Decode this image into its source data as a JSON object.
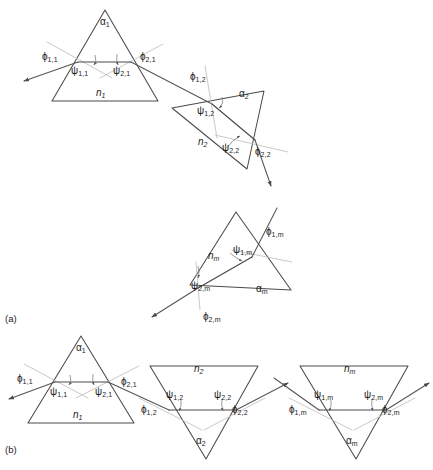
{
  "figure": {
    "background_color": "#ffffff",
    "line_color": "#4a4a4a",
    "normal_color": "#c3c3c3",
    "width": 433,
    "height": 470
  },
  "panels": [
    {
      "id": "a",
      "tag": "(a)",
      "description": "Cascaded prisms with successive rotations"
    },
    {
      "id": "b",
      "tag": "(b)",
      "description": "Alternating upright and inverted prisms in a row"
    }
  ],
  "symbols": {
    "phi": "ϕ",
    "psi": "ψ",
    "alpha": "α",
    "n": "n"
  },
  "labels": {
    "panel_a": {
      "prism1": {
        "apex": {
          "base": "α",
          "sub": "1"
        },
        "index": {
          "base": "n",
          "sub": "1"
        },
        "phi_in": {
          "base": "ϕ",
          "sub": "1,1"
        },
        "phi_out": {
          "base": "ϕ",
          "sub": "2,1"
        },
        "psi_in": {
          "base": "ψ",
          "sub": "1,1"
        },
        "psi_out": {
          "base": "ψ",
          "sub": "2,1"
        }
      },
      "prism2": {
        "apex": {
          "base": "α",
          "sub": "2"
        },
        "index": {
          "base": "n",
          "sub": "2"
        },
        "phi_in": {
          "base": "ϕ",
          "sub": "1,2"
        },
        "phi_out": {
          "base": "ϕ",
          "sub": "2,2"
        },
        "psi_in": {
          "base": "ψ",
          "sub": "1,2"
        },
        "psi_out": {
          "base": "ψ",
          "sub": "2,2"
        }
      },
      "prismM": {
        "apex": {
          "base": "α",
          "sub": "m"
        },
        "index": {
          "base": "n",
          "sub": "m"
        },
        "phi_in": {
          "base": "ϕ",
          "sub": "1,m"
        },
        "phi_out": {
          "base": "ϕ",
          "sub": "2,m"
        },
        "psi_in": {
          "base": "ψ",
          "sub": "1,m"
        },
        "psi_out": {
          "base": "ψ",
          "sub": "2,m"
        }
      }
    },
    "panel_b": {
      "prism1": {
        "apex": {
          "base": "α",
          "sub": "1"
        },
        "index": {
          "base": "n",
          "sub": "1"
        },
        "phi_in": {
          "base": "ϕ",
          "sub": "1,1"
        },
        "phi_out": {
          "base": "ϕ",
          "sub": "2,1"
        },
        "psi_in": {
          "base": "ψ",
          "sub": "1,1"
        },
        "psi_out": {
          "base": "ψ",
          "sub": "2,1"
        }
      },
      "prism2": {
        "apex": {
          "base": "α",
          "sub": "2"
        },
        "index": {
          "base": "n",
          "sub": "2"
        },
        "phi_in": {
          "base": "ϕ",
          "sub": "1,2"
        },
        "phi_out": {
          "base": "ϕ",
          "sub": "2,2"
        },
        "psi_in": {
          "base": "ψ",
          "sub": "1,2"
        },
        "psi_out": {
          "base": "ψ",
          "sub": "2,2"
        }
      },
      "prismM": {
        "apex": {
          "base": "α",
          "sub": "m"
        },
        "index": {
          "base": "n",
          "sub": "m"
        },
        "phi_in": {
          "base": "ϕ",
          "sub": "1,m"
        },
        "phi_out": {
          "base": "ϕ",
          "sub": "2,m"
        },
        "psi_in": {
          "base": "ψ",
          "sub": "1,m"
        },
        "psi_out": {
          "base": "ψ",
          "sub": "2,m"
        }
      }
    }
  },
  "text_items": [
    {
      "name": "a-p1-alpha",
      "text": "α",
      "sub": "1",
      "x": 100,
      "y": 17,
      "italic": false
    },
    {
      "name": "a-p1-n",
      "text": "n",
      "sub": "1",
      "x": 96,
      "y": 88,
      "italic": true
    },
    {
      "name": "a-p1-phi1",
      "text": "ϕ",
      "sub": "1,1",
      "x": 42,
      "y": 52,
      "italic": false
    },
    {
      "name": "a-p1-phi2",
      "text": "ϕ",
      "sub": "2,1",
      "x": 140,
      "y": 52,
      "italic": false
    },
    {
      "name": "a-p1-psi1",
      "text": "ψ",
      "sub": "1,1",
      "x": 71,
      "y": 66,
      "italic": false
    },
    {
      "name": "a-p1-psi2",
      "text": "ψ",
      "sub": "2,1",
      "x": 113,
      "y": 66,
      "italic": false
    },
    {
      "name": "a-p2-alpha",
      "text": "α",
      "sub": "2",
      "x": 239,
      "y": 89,
      "italic": false
    },
    {
      "name": "a-p2-n",
      "text": "n",
      "sub": "2",
      "x": 198,
      "y": 137,
      "italic": true
    },
    {
      "name": "a-p2-phi1",
      "text": "ϕ",
      "sub": "1,2",
      "x": 190,
      "y": 72,
      "italic": false
    },
    {
      "name": "a-p2-phi2",
      "text": "ϕ",
      "sub": "2,2",
      "x": 255,
      "y": 147,
      "italic": false
    },
    {
      "name": "a-p2-psi1",
      "text": "ψ",
      "sub": "1,2",
      "x": 197,
      "y": 106,
      "italic": false
    },
    {
      "name": "a-p2-psi2",
      "text": "ψ",
      "sub": "2,2",
      "x": 222,
      "y": 143,
      "italic": false
    },
    {
      "name": "a-pm-alpha",
      "text": "α",
      "sub": "m",
      "x": 256,
      "y": 284,
      "italic": false
    },
    {
      "name": "a-pm-n",
      "text": "n",
      "sub": "m",
      "x": 208,
      "y": 251,
      "italic": true
    },
    {
      "name": "a-pm-phi1",
      "text": "ϕ",
      "sub": "1,m",
      "x": 266,
      "y": 227,
      "italic": false
    },
    {
      "name": "a-pm-phi2",
      "text": "ϕ",
      "sub": "2,m",
      "x": 203,
      "y": 312,
      "italic": false
    },
    {
      "name": "a-pm-psi1",
      "text": "ψ",
      "sub": "1,m",
      "x": 233,
      "y": 245,
      "italic": false
    },
    {
      "name": "a-pm-psi2",
      "text": "ψ",
      "sub": "2,m",
      "x": 191,
      "y": 281,
      "italic": false
    },
    {
      "name": "b-p1-alpha",
      "text": "α",
      "sub": "1",
      "x": 76,
      "y": 343,
      "italic": false
    },
    {
      "name": "b-p1-n",
      "text": "n",
      "sub": "1",
      "x": 73,
      "y": 410,
      "italic": true
    },
    {
      "name": "b-p1-phi1",
      "text": "ϕ",
      "sub": "1,1",
      "x": 17,
      "y": 374,
      "italic": false
    },
    {
      "name": "b-p1-phi2",
      "text": "ϕ",
      "sub": "2,1",
      "x": 121,
      "y": 377,
      "italic": false
    },
    {
      "name": "b-p1-psi1",
      "text": "ψ",
      "sub": "1,1",
      "x": 50,
      "y": 387,
      "italic": false
    },
    {
      "name": "b-p1-psi2",
      "text": "ψ",
      "sub": "2,1",
      "x": 95,
      "y": 387,
      "italic": false
    },
    {
      "name": "b-p2-alpha",
      "text": "α",
      "sub": "2",
      "x": 196,
      "y": 436,
      "italic": false
    },
    {
      "name": "b-p2-n",
      "text": "n",
      "sub": "2",
      "x": 194,
      "y": 364,
      "italic": true
    },
    {
      "name": "b-p2-phi1",
      "text": "ϕ",
      "sub": "1,2",
      "x": 141,
      "y": 405,
      "italic": false
    },
    {
      "name": "b-p2-phi2",
      "text": "ϕ",
      "sub": "2,2",
      "x": 232,
      "y": 405,
      "italic": false
    },
    {
      "name": "b-p2-psi1",
      "text": "ψ",
      "sub": "1,2",
      "x": 166,
      "y": 390,
      "italic": false
    },
    {
      "name": "b-p2-psi2",
      "text": "ψ",
      "sub": "2,2",
      "x": 214,
      "y": 390,
      "italic": false
    },
    {
      "name": "b-pm-alpha",
      "text": "α",
      "sub": "m",
      "x": 346,
      "y": 436,
      "italic": false
    },
    {
      "name": "b-pm-n",
      "text": "n",
      "sub": "m",
      "x": 344,
      "y": 364,
      "italic": true
    },
    {
      "name": "b-pm-phi1",
      "text": "ϕ",
      "sub": "1,m",
      "x": 289,
      "y": 405,
      "italic": false
    },
    {
      "name": "b-pm-phi2",
      "text": "ϕ",
      "sub": "2,m",
      "x": 382,
      "y": 405,
      "italic": false
    },
    {
      "name": "b-pm-psi1",
      "text": "ψ",
      "sub": "1,m",
      "x": 314,
      "y": 390,
      "italic": false
    },
    {
      "name": "b-pm-psi2",
      "text": "ψ",
      "sub": "2,m",
      "x": 364,
      "y": 390,
      "italic": false
    }
  ],
  "panel_tags": [
    {
      "name": "panel-tag-a",
      "text": "(a)",
      "x": 5,
      "y": 313
    },
    {
      "name": "panel-tag-b",
      "text": "(b)",
      "x": 5,
      "y": 444
    }
  ]
}
